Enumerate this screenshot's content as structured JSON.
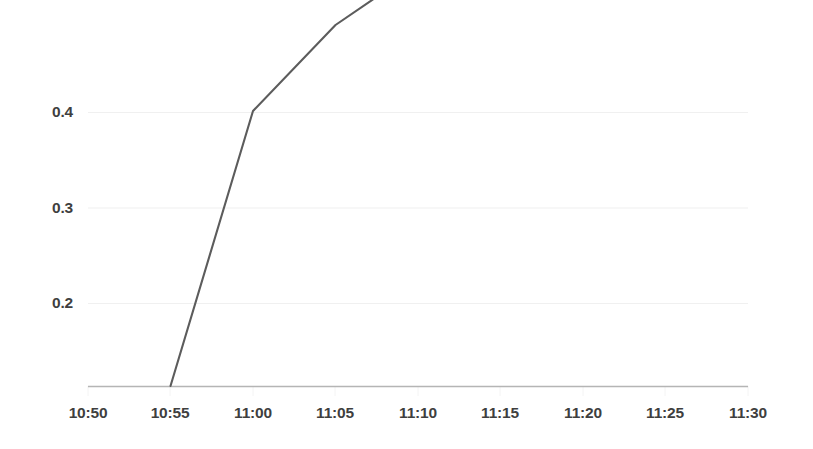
{
  "chart_data": {
    "type": "line",
    "title": "",
    "subtitle": "",
    "xlabel": "",
    "ylabel": "",
    "x": [
      "10:50",
      "10:55",
      "11:00",
      "11:05",
      "11:10",
      "11:15",
      "11:20",
      "11:25",
      "11:30"
    ],
    "series": [
      {
        "name": "series-1",
        "x": [
          "10:55",
          "11:00",
          "11:05",
          "11:10",
          "11:15",
          "11:20",
          "11:25"
        ],
        "values": [
          0.0,
          0.288,
          0.378,
          0.437,
          0.467,
          0.479,
          0.487
        ],
        "color": "#5c5c5c"
      }
    ],
    "xticks": [
      "10:50",
      "10:55",
      "11:00",
      "11:05",
      "11:10",
      "11:15",
      "11:20",
      "11:25",
      "11:30"
    ],
    "yticks": [
      0.2,
      0.3,
      0.4
    ],
    "ytick_labels": [
      "0.2",
      "0.3",
      "0.4"
    ],
    "xlim": [
      "10:50",
      "11:30"
    ],
    "ylim": [
      0.0,
      0.52
    ],
    "grid": true,
    "grid_axis": "y",
    "grid_color": "#f0f0f0",
    "legend": false,
    "legend_position": "none",
    "axis_color": "#b8b8b8",
    "label_color": "#3f3f3f",
    "background": "#ffffff",
    "annotations": []
  },
  "x_axis": {
    "labels": [
      {
        "text": "10:50"
      },
      {
        "text": "10:55"
      },
      {
        "text": "11:00"
      },
      {
        "text": "11:05"
      },
      {
        "text": "11:10"
      },
      {
        "text": "11:15"
      },
      {
        "text": "11:20"
      },
      {
        "text": "11:25"
      },
      {
        "text": "11:30"
      }
    ]
  },
  "y_axis": {
    "labels": [
      {
        "text": "0.4"
      },
      {
        "text": "0.3"
      },
      {
        "text": "0.2"
      }
    ]
  }
}
